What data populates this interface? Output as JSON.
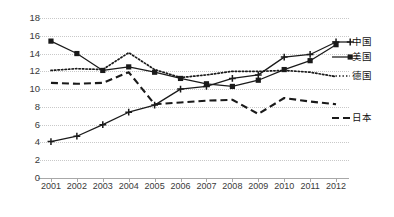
{
  "chart_data": {
    "type": "line",
    "title": "",
    "xlabel": "",
    "ylabel": "",
    "grid": true,
    "legend_position": "right",
    "x": [
      2001,
      2002,
      2003,
      2004,
      2005,
      2006,
      2007,
      2008,
      2009,
      2010,
      2011,
      2012
    ],
    "categories": [
      "2001",
      "2002",
      "2003",
      "2004",
      "2005",
      "2006",
      "2007",
      "2008",
      "2009",
      "2010",
      "2011",
      "2012"
    ],
    "ylim": [
      0,
      18
    ],
    "yticks": [
      0,
      2,
      4,
      6,
      8,
      10,
      12,
      14,
      16,
      18
    ],
    "ytick_labels": [
      "0",
      "2",
      "4",
      "6",
      "8",
      "10",
      "12",
      "14",
      "16",
      "18"
    ],
    "series": [
      {
        "name": "中国",
        "marker": "plus",
        "line_style": "solid",
        "color": "#1a1a1a",
        "values": [
          4.1,
          4.7,
          6.0,
          7.4,
          8.2,
          10.0,
          10.3,
          11.2,
          11.6,
          13.6,
          13.9,
          15.3
        ]
      },
      {
        "name": "美国",
        "marker": "square",
        "line_style": "solid",
        "color": "#1a1a1a",
        "values": [
          15.4,
          14.0,
          12.1,
          12.5,
          11.9,
          11.2,
          10.6,
          10.3,
          11.0,
          12.2,
          13.2,
          15.0
        ]
      },
      {
        "name": "德国",
        "marker": "none",
        "line_style": "dotted",
        "color": "#1a1a1a",
        "values": [
          12.1,
          12.3,
          12.2,
          14.1,
          12.2,
          11.3,
          11.6,
          12.0,
          12.0,
          12.1,
          11.9,
          11.4
        ]
      },
      {
        "name": "日本",
        "marker": "none",
        "line_style": "dashed",
        "color": "#1a1a1a",
        "values": [
          10.7,
          10.6,
          10.7,
          11.9,
          8.3,
          8.5,
          8.7,
          8.8,
          7.2,
          9.0,
          8.6,
          8.3
        ]
      }
    ]
  },
  "legend": {
    "china": "中国",
    "usa": "美国",
    "germany": "德国",
    "japan": "日本"
  }
}
